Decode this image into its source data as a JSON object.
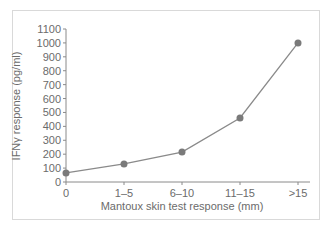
{
  "chart_data": {
    "type": "line",
    "title": "",
    "xlabel": "Mantoux skin test response (mm)",
    "ylabel": "IFNγ response (pg/ml)",
    "categories": [
      "0",
      "1–5",
      "6–10",
      "11–15",
      ">15"
    ],
    "series": [
      {
        "name": "IFNγ response",
        "values": [
          65,
          130,
          215,
          460,
          1000
        ]
      }
    ],
    "yticks": [
      0,
      100,
      200,
      300,
      400,
      500,
      600,
      700,
      800,
      900,
      1000,
      1100
    ],
    "ylim": [
      0,
      1100
    ],
    "grid": false,
    "legend": "none",
    "colors": {
      "line": "#8a8a8a",
      "marker": "#7a7a7a",
      "axis": "#8a8a8a",
      "text": "#6b6b6b"
    }
  }
}
